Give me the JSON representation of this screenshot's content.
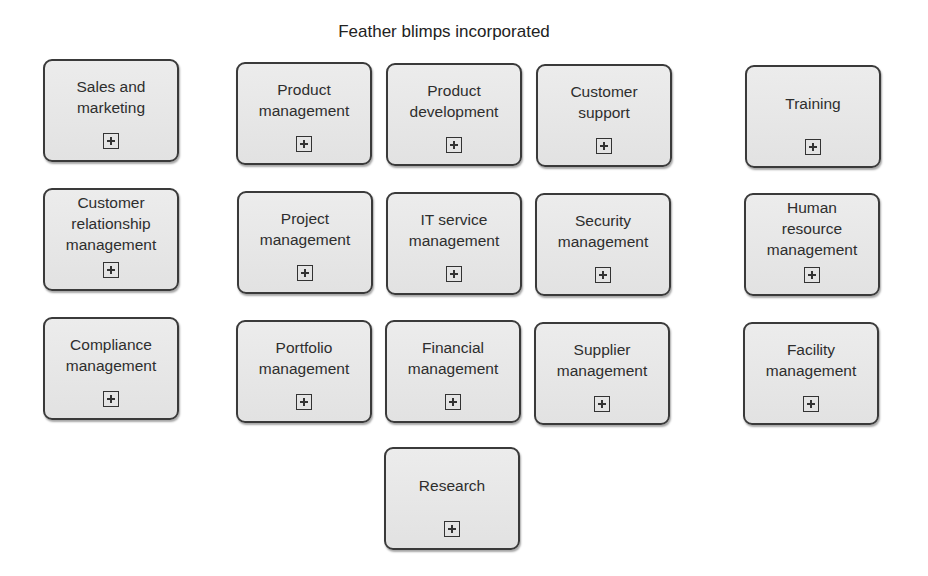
{
  "diagram": {
    "title": "Feather blimps incorporated",
    "expand_icon": "plus-in-square-icon",
    "nodes": [
      {
        "id": "sales-and-marketing",
        "label": "Sales and\nmarketing",
        "x": 43,
        "y": 59
      },
      {
        "id": "product-management",
        "label": "Product\nmanagement",
        "x": 236,
        "y": 62
      },
      {
        "id": "product-development",
        "label": "Product\ndevelopment",
        "x": 386,
        "y": 63
      },
      {
        "id": "customer-support",
        "label": "Customer\nsupport",
        "x": 536,
        "y": 64
      },
      {
        "id": "training",
        "label": "Training",
        "x": 745,
        "y": 65
      },
      {
        "id": "customer-relationship-management",
        "label": "Customer\nrelationship\nmanagement",
        "x": 43,
        "y": 188
      },
      {
        "id": "project-management",
        "label": "Project\nmanagement",
        "x": 237,
        "y": 191
      },
      {
        "id": "it-service-management",
        "label": "IT service\nmanagement",
        "x": 386,
        "y": 192
      },
      {
        "id": "security-management",
        "label": "Security\nmanagement",
        "x": 535,
        "y": 193
      },
      {
        "id": "human-resource-management",
        "label": "Human\nresource\nmanagement",
        "x": 744,
        "y": 193
      },
      {
        "id": "compliance-management",
        "label": "Compliance\nmanagement",
        "x": 43,
        "y": 317
      },
      {
        "id": "portfolio-management",
        "label": "Portfolio\nmanagement",
        "x": 236,
        "y": 320
      },
      {
        "id": "financial-management",
        "label": "Financial\nmanagement",
        "x": 385,
        "y": 320
      },
      {
        "id": "supplier-management",
        "label": "Supplier\nmanagement",
        "x": 534,
        "y": 322
      },
      {
        "id": "facility-management",
        "label": "Facility\nmanagement",
        "x": 743,
        "y": 322
      },
      {
        "id": "research",
        "label": "Research",
        "x": 384,
        "y": 447
      }
    ]
  }
}
